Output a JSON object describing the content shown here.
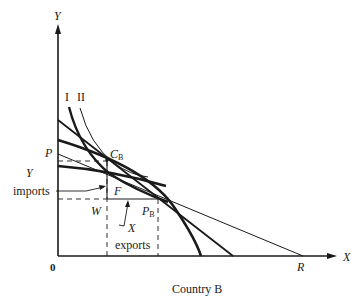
{
  "diagram": {
    "caption": "Country B",
    "axes": {
      "y_label": "Y",
      "x_label": "X",
      "origin_label": "0"
    },
    "curve_labels": {
      "indifference_1": "I",
      "indifference_2": "II"
    },
    "points": {
      "P": "P",
      "R": "R",
      "C_B_main": "C",
      "C_B_sub": "B",
      "F": "F",
      "W": "W",
      "P_B_main": "P",
      "P_B_sub": "B"
    },
    "annotations": {
      "y_imports_line1": "Y",
      "y_imports_line2": "imports",
      "x_exports_line1": "X",
      "x_exports_line2": "exports"
    },
    "colors": {
      "ink": "#1a1a1a",
      "background": "#ffffff"
    }
  }
}
